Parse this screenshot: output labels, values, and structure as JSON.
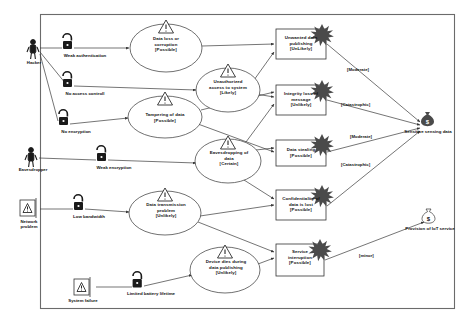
{
  "diagram": {
    "frame": {
      "x": 40,
      "y": 14,
      "width": 415,
      "height": 295
    }
  },
  "actors": [
    {
      "id": "hacker",
      "name": "Hacker",
      "icon": "person-icon",
      "x": 33,
      "y": 44
    },
    {
      "id": "eavesdropper",
      "name": "Eavesdropper",
      "icon": "person-icon",
      "x": 31,
      "y": 152
    },
    {
      "id": "network",
      "name": "Network\nproblem",
      "icon": "warning-box-icon",
      "x": 28,
      "y": 203
    },
    {
      "id": "sysfailure",
      "name": "System failure",
      "icon": "warning-box-icon",
      "x": 82,
      "y": 283
    }
  ],
  "vulnerabilities": [
    {
      "id": "weak-auth",
      "name": "Weak authentication",
      "icon": "open-padlock-icon",
      "x": 66,
      "y": 42
    },
    {
      "id": "no-access",
      "name": "No access controll",
      "icon": "open-padlock-icon",
      "x": 66,
      "y": 80
    },
    {
      "id": "no-encryption",
      "name": "No encryption",
      "icon": "open-padlock-icon",
      "x": 62,
      "y": 118
    },
    {
      "id": "weak-encrypt",
      "name": "Weak encryption",
      "icon": "open-padlock-icon",
      "x": 100,
      "y": 157
    },
    {
      "id": "low-bandwidth",
      "name": "Low bandwidth",
      "icon": "open-padlock-icon",
      "x": 77,
      "y": 205
    },
    {
      "id": "battery",
      "name": "Limited battery lifetime",
      "icon": "closed-padlock-icon",
      "x": 136,
      "y": 282
    }
  ],
  "threats": [
    {
      "id": "t-dataloss",
      "label": "Data loss or\ncorruption\n[Possible]",
      "cx": 166,
      "cy": 48,
      "rx": 36,
      "ry": 24
    },
    {
      "id": "t-unauth",
      "label": "Unauthorized\naccess to system\n[Likely]",
      "cx": 228,
      "cy": 90,
      "rx": 32,
      "ry": 22
    },
    {
      "id": "t-tampering",
      "label": "Tampering of data\n[Possible]",
      "cx": 165,
      "cy": 117,
      "rx": 37,
      "ry": 21
    },
    {
      "id": "t-eavesdrop",
      "label": "Eavesdropping of\ndata\n[Certain]",
      "cx": 228,
      "cy": 161,
      "rx": 33,
      "ry": 22
    },
    {
      "id": "t-transmit",
      "label": "Data transmission\nproblem\n[Unlikely]",
      "cx": 165,
      "cy": 213,
      "rx": 36,
      "ry": 22
    },
    {
      "id": "t-devicedies",
      "label": "Device dies during\ndata publishing\n[Unlikely]",
      "cx": 225,
      "cy": 270,
      "rx": 35,
      "ry": 23
    }
  ],
  "consequences": [
    {
      "id": "c-unwanted",
      "label": "Unwanted data\npublishing\n[UnLikely]",
      "x": 276,
      "y": 29,
      "width": 50,
      "height": 30
    },
    {
      "id": "c-integrity",
      "label": "Integrity loss of\nmessage\n[Unlikely]",
      "x": 276,
      "y": 85,
      "width": 50,
      "height": 30
    },
    {
      "id": "c-stealing",
      "label": "Data stealing\n[Possible]",
      "x": 276,
      "y": 140,
      "width": 50,
      "height": 26
    },
    {
      "id": "c-confident",
      "label": "Confidentiality of\ndata is lost\n[Possible]",
      "x": 276,
      "y": 190,
      "width": 50,
      "height": 30
    },
    {
      "id": "c-service",
      "label": "Service\ninteruption\n[Possible]",
      "x": 276,
      "y": 244,
      "width": 48,
      "height": 32
    }
  ],
  "assets": [
    {
      "id": "a-sensing",
      "name": "Sensitive sensing data",
      "icon": "money-bag-icon",
      "x": 427,
      "y": 117
    },
    {
      "id": "a-service",
      "name": "Provision of IoT service",
      "icon": "money-bag-icon",
      "x": 428,
      "y": 214
    }
  ],
  "impact_labels": [
    {
      "id": "i-1",
      "text": "[Moderate]",
      "x": 347,
      "y": 70
    },
    {
      "id": "i-2",
      "text": "[Catastrophic]",
      "x": 344,
      "y": 105
    },
    {
      "id": "i-3",
      "text": "[Moderate]",
      "x": 351,
      "y": 137
    },
    {
      "id": "i-4",
      "text": "[Catastrophic]",
      "x": 344,
      "y": 165
    },
    {
      "id": "i-5",
      "text": "[minor]",
      "x": 360,
      "y": 256
    }
  ],
  "colors": {
    "line": "#3a3a3a",
    "node_stroke": "#333333",
    "text": "#111111",
    "background": "#ffffff"
  }
}
